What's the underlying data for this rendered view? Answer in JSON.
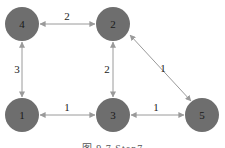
{
  "graph": {
    "nodes": [
      {
        "id": "4",
        "label": "4",
        "cx": 22,
        "cy": 24
      },
      {
        "id": "2",
        "label": "2",
        "cx": 113,
        "cy": 24
      },
      {
        "id": "1",
        "label": "1",
        "cx": 22,
        "cy": 115
      },
      {
        "id": "3",
        "label": "3",
        "cx": 113,
        "cy": 115
      },
      {
        "id": "5",
        "label": "5",
        "cx": 202,
        "cy": 115
      }
    ],
    "edges": [
      {
        "from": "4",
        "to": "2",
        "weight": "2"
      },
      {
        "from": "4",
        "to": "1",
        "weight": "3"
      },
      {
        "from": "2",
        "to": "3",
        "weight": "2"
      },
      {
        "from": "1",
        "to": "3",
        "weight": "1"
      },
      {
        "from": "3",
        "to": "5",
        "weight": "1"
      },
      {
        "from": "2",
        "to": "5",
        "weight": "1"
      }
    ],
    "node_color": "#6e6e6e",
    "edge_color": "#9a9a9a"
  },
  "caption": "图 9.7   Step7"
}
